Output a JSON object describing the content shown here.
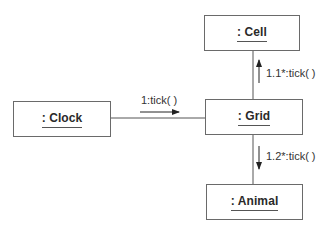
{
  "diagram": {
    "type": "uml-communication-diagram",
    "objects": [
      {
        "id": "clock",
        "label": ": Clock"
      },
      {
        "id": "grid",
        "label": ": Grid"
      },
      {
        "id": "cell",
        "label": ": Cell"
      },
      {
        "id": "animal",
        "label": ": Animal"
      }
    ],
    "links": [
      {
        "from": "clock",
        "to": "grid"
      },
      {
        "from": "grid",
        "to": "cell"
      },
      {
        "from": "grid",
        "to": "animal"
      }
    ],
    "messages": [
      {
        "label": "1:tick( )",
        "from": "clock",
        "to": "grid",
        "direction": "right"
      },
      {
        "label": "1.1*:tick( )",
        "from": "grid",
        "to": "cell",
        "direction": "up"
      },
      {
        "label": "1.2*:tick( )",
        "from": "grid",
        "to": "animal",
        "direction": "down"
      }
    ],
    "colors": {
      "line": "#555555",
      "box_border": "#6a6a6a",
      "background": "#ffffff"
    }
  }
}
